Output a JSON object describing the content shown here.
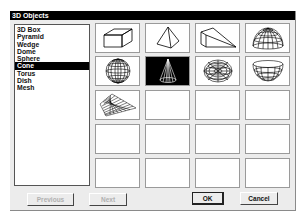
{
  "dialog": {
    "title": "3D Objects"
  },
  "list": {
    "items": [
      {
        "label": "3D Box",
        "selected": false
      },
      {
        "label": "Pyramid",
        "selected": false
      },
      {
        "label": "Wedge",
        "selected": false
      },
      {
        "label": "Dome",
        "selected": false
      },
      {
        "label": "Sphere",
        "selected": false
      },
      {
        "label": "Cone",
        "selected": true
      },
      {
        "label": "Torus",
        "selected": false
      },
      {
        "label": "Dish",
        "selected": false
      },
      {
        "label": "Mesh",
        "selected": false
      }
    ]
  },
  "grid": {
    "columns": 4,
    "rows": 5,
    "cells": [
      {
        "icon": "box-icon"
      },
      {
        "icon": "pyramid-icon"
      },
      {
        "icon": "wedge-icon"
      },
      {
        "icon": "dome-icon"
      },
      {
        "icon": "sphere-icon"
      },
      {
        "icon": "cone-icon",
        "selected": true
      },
      {
        "icon": "torus-icon"
      },
      {
        "icon": "dish-icon"
      },
      {
        "icon": "mesh-icon"
      },
      {
        "icon": ""
      },
      {
        "icon": ""
      },
      {
        "icon": ""
      },
      {
        "icon": ""
      },
      {
        "icon": ""
      },
      {
        "icon": ""
      },
      {
        "icon": ""
      },
      {
        "icon": ""
      },
      {
        "icon": ""
      },
      {
        "icon": ""
      },
      {
        "icon": ""
      }
    ]
  },
  "buttons": {
    "previous": "Previous",
    "next": "Next",
    "ok": "OK",
    "cancel": "Cancel"
  }
}
